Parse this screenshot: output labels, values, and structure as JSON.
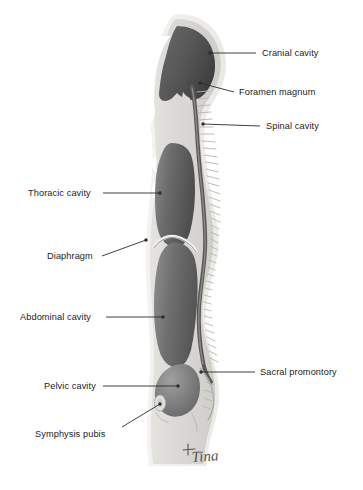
{
  "figure": {
    "background_color": "#ffffff",
    "body_fill_color": "#d9d7d3",
    "body_edge_color": "#eceae7",
    "cavity_fill_color": "#6e6e6e",
    "cavity_dark_color": "#4a4a4a",
    "cavity_light_color": "#8c8c8c",
    "spine_color": "#5f5d5a",
    "leader_color": "#2b2b2b",
    "signature": "Tina"
  },
  "labels": [
    {
      "id": "cranial-cavity",
      "text": "Cranial cavity",
      "side": "right",
      "text_x": 262,
      "text_y": 48,
      "leader": {
        "x1": 256,
        "y1": 53,
        "x2": 210,
        "y2": 53
      },
      "dot": {
        "x": 210,
        "y": 53
      }
    },
    {
      "id": "foramen-magnum",
      "text": "Foramen magnum",
      "side": "right",
      "text_x": 239,
      "text_y": 87,
      "leader": {
        "x1": 234,
        "y1": 92,
        "x2": 200,
        "y2": 83
      },
      "dot": {
        "x": 200,
        "y": 83
      }
    },
    {
      "id": "spinal-cavity",
      "text": "Spinal cavity",
      "side": "right",
      "text_x": 266,
      "text_y": 121,
      "leader": {
        "x1": 260,
        "y1": 126,
        "x2": 203,
        "y2": 124
      },
      "dot": {
        "x": 203,
        "y": 124
      }
    },
    {
      "id": "thoracic-cavity",
      "text": "Thoracic cavity",
      "side": "left",
      "text_x": 28,
      "text_y": 188,
      "leader": {
        "x1": 103,
        "y1": 193,
        "x2": 160,
        "y2": 193
      },
      "dot": {
        "x": 160,
        "y": 193
      }
    },
    {
      "id": "diaphragm",
      "text": "Diaphragm",
      "side": "left",
      "text_x": 47,
      "text_y": 251,
      "leader": {
        "x1": 102,
        "y1": 256,
        "x2": 146,
        "y2": 240
      },
      "dot": {
        "x": 146,
        "y": 240
      }
    },
    {
      "id": "abdominal-cavity",
      "text": "Abdominal cavity",
      "side": "left",
      "text_x": 20,
      "text_y": 312,
      "leader": {
        "x1": 106,
        "y1": 317,
        "x2": 163,
        "y2": 317
      },
      "dot": {
        "x": 163,
        "y": 317
      }
    },
    {
      "id": "pelvic-cavity",
      "text": "Pelvic cavity",
      "side": "left",
      "text_x": 44,
      "text_y": 381,
      "leader": {
        "x1": 103,
        "y1": 386,
        "x2": 178,
        "y2": 386
      },
      "dot": {
        "x": 178,
        "y": 386
      }
    },
    {
      "id": "sacral-promontory",
      "text": "Sacral promontory",
      "side": "right",
      "text_x": 260,
      "text_y": 367,
      "leader": {
        "x1": 255,
        "y1": 372,
        "x2": 201,
        "y2": 372
      },
      "dot": {
        "x": 201,
        "y": 372
      }
    },
    {
      "id": "symphysis-pubis",
      "text": "Symphysis pubis",
      "side": "left",
      "text_x": 35,
      "text_y": 429,
      "leader": {
        "x1": 122,
        "y1": 427,
        "x2": 160,
        "y2": 404
      },
      "dot": {
        "x": 160,
        "y": 404
      }
    }
  ]
}
